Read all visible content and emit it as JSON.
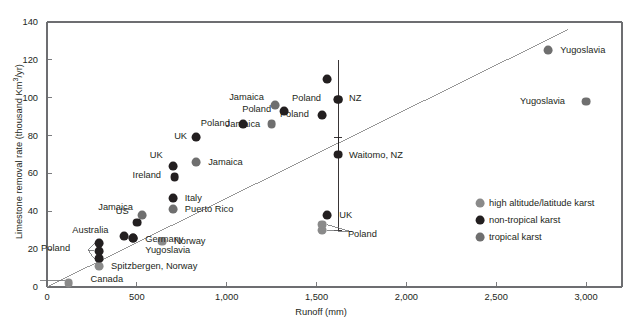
{
  "chart_data": {
    "type": "scatter",
    "title": "",
    "xlabel": "Runoff (mm)",
    "ylabel": "Limestone removal rate (thousand Km3/yr)",
    "ylabel_prefix": "Limestone removal rate (thousand Km",
    "ylabel_sup": "3",
    "ylabel_suffix": "/yr)",
    "xlim": [
      0,
      3200
    ],
    "ylim": [
      0,
      140
    ],
    "xticks": [
      0,
      500,
      1000,
      1500,
      2000,
      2500,
      3000
    ],
    "xticklabels": [
      "0",
      "500",
      "1,000",
      "1,500",
      "2,000",
      "2,500",
      "3,000"
    ],
    "yticks": [
      0,
      20,
      40,
      60,
      80,
      100,
      120,
      140
    ],
    "yticklabels": [
      "0",
      "20",
      "40",
      "60",
      "80",
      "100",
      "120",
      "140"
    ],
    "grid": false,
    "legend_position": "lower-right",
    "trendline": {
      "x0": 0,
      "y0": 0,
      "x1": 2900,
      "y1": 136
    },
    "legend": [
      {
        "label": "high altitude/latitude karst",
        "color": "#8a8a8a"
      },
      {
        "label": "non-tropical karst",
        "color": "#231f20"
      },
      {
        "label": "tropical karst",
        "color": "#6f6f6f"
      }
    ],
    "series": [
      {
        "name": "high altitude/latitude karst",
        "color": "#8a8a8a",
        "points": [
          {
            "label": "Canada",
            "x": 120,
            "y": 2,
            "lx": 22,
            "ly": -4
          },
          {
            "label": "Spitzbergen, Norway",
            "x": 290,
            "y": 11,
            "lx": 12,
            "ly": 0
          },
          {
            "label": "Norway",
            "x": 640,
            "y": 24,
            "lx": 12,
            "ly": 0
          },
          {
            "label": "Poland",
            "x": 1530,
            "y": 30,
            "lx": 26,
            "ly": 4,
            "leader": true
          },
          {
            "label": "",
            "x": 1530,
            "y": 33,
            "lx": 0,
            "ly": 0
          }
        ]
      },
      {
        "name": "non-tropical karst",
        "color": "#231f20",
        "points": [
          {
            "label": "Poland",
            "x": 290,
            "y": 15,
            "lx": -58,
            "ly": -10,
            "leader": true
          },
          {
            "label": "",
            "x": 290,
            "y": 19,
            "lx": 0,
            "ly": 0
          },
          {
            "label": "",
            "x": 290,
            "y": 23,
            "lx": 0,
            "ly": 0
          },
          {
            "label": "Australia",
            "x": 430,
            "y": 27,
            "lx": -52,
            "ly": -5
          },
          {
            "label": "US",
            "x": 500,
            "y": 34,
            "lx": -21,
            "ly": -11
          },
          {
            "label": "Germany",
            "x": 480,
            "y": 26,
            "lx": 12,
            "ly": 2
          },
          {
            "label": "Yugoslavia",
            "x": 480,
            "y": 26,
            "lx": 12,
            "ly": 13
          },
          {
            "label": "Italy",
            "x": 700,
            "y": 47,
            "lx": 12,
            "ly": 0
          },
          {
            "label": "Ireland",
            "x": 710,
            "y": 58,
            "lx": -42,
            "ly": -2
          },
          {
            "label": "UK",
            "x": 700,
            "y": 64,
            "lx": -23,
            "ly": -10
          },
          {
            "label": "UK",
            "x": 830,
            "y": 79,
            "lx": -22,
            "ly": -1
          },
          {
            "label": "Poland",
            "x": 1090,
            "y": 86,
            "lx": -42,
            "ly": -1
          },
          {
            "label": "Poland",
            "x": 1320,
            "y": 93,
            "lx": -42,
            "ly": -1
          },
          {
            "label": "Poland",
            "x": 1530,
            "y": 91,
            "lx": -42,
            "ly": 0
          },
          {
            "label": "",
            "x": 1560,
            "y": 110,
            "lx": 0,
            "ly": 0
          },
          {
            "label": "NZ",
            "x": 1620,
            "y": 99,
            "lx": 11,
            "ly": -1
          },
          {
            "label": "Poland",
            "x": 1620,
            "y": 99,
            "lx": -46,
            "ly": -1
          },
          {
            "label": "Waitomo, NZ",
            "x": 1620,
            "y": 70,
            "lx": 11,
            "ly": 1
          },
          {
            "label": "UK",
            "x": 1560,
            "y": 38,
            "lx": 12,
            "ly": 0
          }
        ]
      },
      {
        "name": "tropical karst",
        "color": "#6f6f6f",
        "points": [
          {
            "label": "Jamaica",
            "x": 530,
            "y": 38,
            "lx": -44,
            "ly": -8
          },
          {
            "label": "Puerto Rico",
            "x": 700,
            "y": 41,
            "lx": 12,
            "ly": 0
          },
          {
            "label": "Jamaica",
            "x": 830,
            "y": 66,
            "lx": 12,
            "ly": 0
          },
          {
            "label": "Jamaica",
            "x": 1250,
            "y": 86,
            "lx": -46,
            "ly": 0
          },
          {
            "label": "Jamaica",
            "x": 1270,
            "y": 96,
            "lx": -46,
            "ly": -8
          },
          {
            "label": "Yugoslavia",
            "x": 2790,
            "y": 125,
            "lx": 12,
            "ly": 0
          },
          {
            "label": "Yugoslavia",
            "x": 3000,
            "y": 98,
            "lx": -66,
            "ly": 0
          }
        ]
      }
    ],
    "errorbars": [
      {
        "x": 1620,
        "y": 99,
        "ymin": 70,
        "ymax": 120,
        "caps": false
      },
      {
        "x": 1620,
        "y": 70,
        "ymin": 30,
        "ymax": 79,
        "caps": true
      }
    ]
  }
}
